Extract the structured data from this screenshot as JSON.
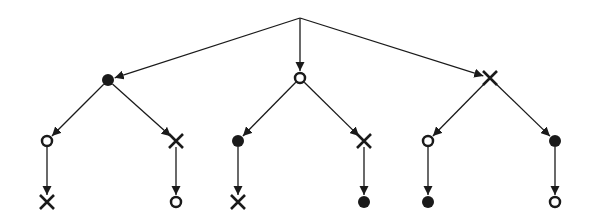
{
  "diagram": {
    "type": "tree",
    "colors": {
      "stroke": "#1a1a1a",
      "fill": "#1a1a1a",
      "background": "#ffffff"
    },
    "root": {
      "id": "root",
      "x": 300,
      "y": 18,
      "marker": "none"
    },
    "nodes": [
      {
        "id": "a",
        "x": 108,
        "y": 80,
        "marker": "filled-circle",
        "parent": "root"
      },
      {
        "id": "b",
        "x": 300,
        "y": 78,
        "marker": "open-circle",
        "parent": "root"
      },
      {
        "id": "c",
        "x": 490,
        "y": 78,
        "marker": "cross",
        "parent": "root"
      },
      {
        "id": "a1",
        "x": 47,
        "y": 141,
        "marker": "open-circle",
        "parent": "a"
      },
      {
        "id": "a2",
        "x": 176,
        "y": 141,
        "marker": "cross",
        "parent": "a"
      },
      {
        "id": "b1",
        "x": 238,
        "y": 141,
        "marker": "filled-circle",
        "parent": "b"
      },
      {
        "id": "b2",
        "x": 364,
        "y": 141,
        "marker": "cross",
        "parent": "b"
      },
      {
        "id": "c1",
        "x": 428,
        "y": 141,
        "marker": "open-circle",
        "parent": "c"
      },
      {
        "id": "c2",
        "x": 555,
        "y": 141,
        "marker": "filled-circle",
        "parent": "c"
      },
      {
        "id": "a1x",
        "x": 47,
        "y": 202,
        "marker": "cross",
        "parent": "a1"
      },
      {
        "id": "a2x",
        "x": 176,
        "y": 202,
        "marker": "open-circle",
        "parent": "a2"
      },
      {
        "id": "b1x",
        "x": 238,
        "y": 202,
        "marker": "cross",
        "parent": "b1"
      },
      {
        "id": "b2x",
        "x": 364,
        "y": 202,
        "marker": "filled-circle",
        "parent": "b2"
      },
      {
        "id": "c1x",
        "x": 428,
        "y": 202,
        "marker": "filled-circle",
        "parent": "c1"
      },
      {
        "id": "c2x",
        "x": 555,
        "y": 202,
        "marker": "open-circle",
        "parent": "c2"
      }
    ]
  }
}
